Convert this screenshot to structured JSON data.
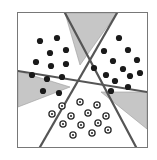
{
  "figure": {
    "title": "",
    "panel": {
      "x": 17,
      "y": 12,
      "width": 131,
      "height": 136,
      "background_color": "#ffffff",
      "border_color": "#787878",
      "border_width": 1
    },
    "viewbox": {
      "width": 129,
      "height": 134
    },
    "style": {
      "wedge_fill": "#c6c6c6",
      "wedge_stroke": "#9a9a9a",
      "partition_line_color": "#555555",
      "partition_line_width": 2.2,
      "filled_dot_color": "#1a1a1a",
      "open_dot_stroke": "#2b2b2b",
      "open_dot_fill": "#ffffff",
      "dot_radius": 3.1,
      "open_dot_radius": 3.1,
      "open_dot_inner_radius": 1.1
    },
    "center_triangle": [
      {
        "x": 62,
        "y": 52
      },
      {
        "x": 52,
        "y": 74
      },
      {
        "x": 83,
        "y": 79
      }
    ],
    "wedges": [
      {
        "name": "top-wedge",
        "points": "62,52 47,0 99,0"
      },
      {
        "name": "left-wedge",
        "points": "52,74 0,58 0,94"
      },
      {
        "name": "bottom-right-wedge",
        "points": "83,79 129,79 129,116"
      }
    ],
    "partition_lines": [
      {
        "name": "line-top-left-to-bottom-right",
        "x1": 47,
        "y1": 0,
        "x2": 118,
        "y2": 134
      },
      {
        "name": "line-top-right-to-bottom-left",
        "x1": 99,
        "y1": 0,
        "x2": 22,
        "y2": 134
      },
      {
        "name": "line-left-to-right",
        "x1": 0,
        "y1": 58,
        "x2": 129,
        "y2": 79
      }
    ],
    "clusters": [
      {
        "name": "upper-left-cluster",
        "marker": "filled-dot",
        "count": 12,
        "points": [
          {
            "x": 22,
            "y": 28
          },
          {
            "x": 39,
            "y": 25
          },
          {
            "x": 32,
            "y": 40
          },
          {
            "x": 48,
            "y": 37
          },
          {
            "x": 18,
            "y": 49
          },
          {
            "x": 33,
            "y": 53
          },
          {
            "x": 48,
            "y": 51
          },
          {
            "x": 14,
            "y": 62
          },
          {
            "x": 29,
            "y": 66
          },
          {
            "x": 44,
            "y": 64
          },
          {
            "x": 25,
            "y": 78
          },
          {
            "x": 41,
            "y": 80
          }
        ]
      },
      {
        "name": "upper-right-cluster",
        "marker": "filled-dot",
        "count": 13,
        "points": [
          {
            "x": 101,
            "y": 25
          },
          {
            "x": 86,
            "y": 38
          },
          {
            "x": 110,
            "y": 37
          },
          {
            "x": 95,
            "y": 48
          },
          {
            "x": 119,
            "y": 47
          },
          {
            "x": 76,
            "y": 55
          },
          {
            "x": 105,
            "y": 56
          },
          {
            "x": 88,
            "y": 62
          },
          {
            "x": 112,
            "y": 63
          },
          {
            "x": 122,
            "y": 60
          },
          {
            "x": 97,
            "y": 68
          },
          {
            "x": 93,
            "y": 78
          },
          {
            "x": 110,
            "y": 74
          }
        ]
      },
      {
        "name": "bottom-cluster",
        "marker": "open-circle",
        "count": 13,
        "points": [
          {
            "x": 44,
            "y": 93
          },
          {
            "x": 62,
            "y": 89
          },
          {
            "x": 79,
            "y": 92
          },
          {
            "x": 34,
            "y": 101
          },
          {
            "x": 53,
            "y": 103
          },
          {
            "x": 70,
            "y": 100
          },
          {
            "x": 88,
            "y": 103
          },
          {
            "x": 45,
            "y": 111
          },
          {
            "x": 63,
            "y": 112
          },
          {
            "x": 80,
            "y": 110
          },
          {
            "x": 55,
            "y": 122
          },
          {
            "x": 74,
            "y": 120
          },
          {
            "x": 90,
            "y": 117
          }
        ]
      }
    ]
  }
}
